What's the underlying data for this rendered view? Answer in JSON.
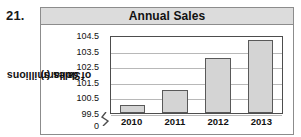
{
  "problem_number": "21.",
  "chart_data": {
    "type": "bar",
    "title": "Annual Sales",
    "xlabel": "",
    "ylabel": "Sales (millions of dollars)",
    "ylabel_line1": "Sales (millions",
    "ylabel_line2": "of dollars)",
    "categories": [
      "2010",
      "2011",
      "2012",
      "2013"
    ],
    "values": [
      100.0,
      101.0,
      103.0,
      104.2
    ],
    "ytick_labels": [
      "104.5",
      "103.5",
      "102.5",
      "101.5",
      "100.5",
      "99.5"
    ],
    "ytick_values": [
      104.5,
      103.5,
      102.5,
      101.5,
      100.5,
      99.5
    ],
    "y_zero_label": "0",
    "ylim": [
      99.5,
      104.5
    ],
    "axis_break": true,
    "grid": true,
    "legend": false,
    "bar_fill_color": "#d4d4d4",
    "bar_border_color": "#595959",
    "gridline_color": "#b8b8b8",
    "title_bar_color": "#dcdcdc",
    "frame_color": "#8c8c8c"
  }
}
